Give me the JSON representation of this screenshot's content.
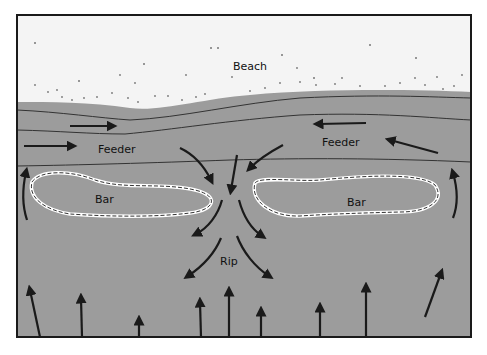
{
  "diagram": {
    "type": "rip current schematic",
    "colors": {
      "water": "#9c9c9c",
      "nearshore_band": "#8e8e8e",
      "beach": "#f4f4f4",
      "frame": "#1a1a1a",
      "arrow": "#1a1a1a",
      "bar_outline": "#ffffff",
      "sand_dot": "#777777"
    },
    "labels": {
      "beach": "Beach",
      "feeder_left": "Feeder",
      "feeder_right": "Feeder",
      "bar_left": "Bar",
      "bar_right": "Bar",
      "rip": "Rip"
    }
  }
}
